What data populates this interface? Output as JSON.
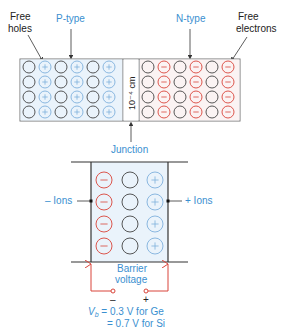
{
  "colors": {
    "accent_blue": "#3a8fd0",
    "ion_red": "#d9443a",
    "hole_blue": "#7fb0dc",
    "region_tint": "#eef5fb",
    "line": "#333333"
  },
  "top_diagram": {
    "labels": {
      "free_holes_line1": "Free",
      "free_holes_line2": "holes",
      "p_type": "P-type",
      "n_type": "N-type",
      "free_electrons_line1": "Free",
      "free_electrons_line2": "electrons",
      "junction_width": "10⁻⁴ cm",
      "junction": "Junction"
    },
    "p_region": {
      "rows": 4,
      "cols": 6,
      "pattern": [
        "atom",
        "hole",
        "atom",
        "hole",
        "atom",
        "hole"
      ]
    },
    "n_region": {
      "rows": 4,
      "cols": 6,
      "pattern": [
        "atom",
        "electron",
        "atom",
        "electron",
        "atom",
        "electron"
      ]
    }
  },
  "depletion_diagram": {
    "labels": {
      "neg_ions": "– Ions",
      "pos_ions": "+ Ions",
      "barrier_line1": "Barrier",
      "barrier_line2": "voltage",
      "minus_terminal": "–",
      "plus_terminal": "+",
      "vb_symbol": "V",
      "vb_subscript": "b",
      "vb_ge": " = 0.3 V for Ge",
      "vb_si": "= 0.7 V for Si"
    },
    "columns": [
      "negative-ion",
      "atom",
      "positive-ion"
    ],
    "rows": 4
  }
}
